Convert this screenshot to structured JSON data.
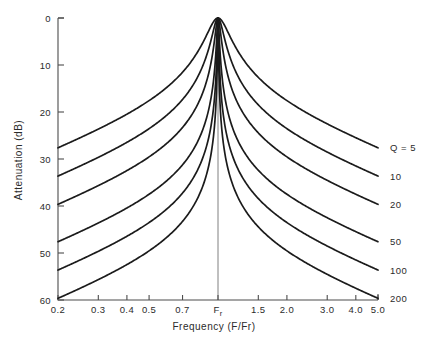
{
  "chart_data": {
    "type": "line",
    "title": "",
    "subtitle": "",
    "xlabel": "Frequency  (F/Fr)",
    "ylabel": "Attenuation  (dB)",
    "xscale": "log",
    "xlim": [
      0.2,
      5.0
    ],
    "ylim": [
      0,
      60
    ],
    "y_inverted": true,
    "grid": false,
    "legend_position": "right-inline",
    "x_tick_values": [
      0.2,
      0.3,
      0.4,
      0.5,
      0.7,
      1.0,
      1.5,
      2.0,
      3.0,
      4.0,
      5.0
    ],
    "x_tick_labels": [
      "0.2",
      "0.3",
      "0.4",
      "0.5",
      "0.7",
      "Fr",
      "1.5",
      "2.0",
      "3.0",
      "4.0",
      "5.0"
    ],
    "y_tick_values": [
      0,
      10,
      20,
      30,
      40,
      50,
      60
    ],
    "y_tick_labels": [
      "0",
      "10",
      "20",
      "30",
      "40",
      "50",
      "60"
    ],
    "center_marker": {
      "label": "Fr",
      "label_base": "F",
      "label_sub": "r",
      "value": 1.0
    },
    "series_label_prefix": "Q =",
    "series": [
      {
        "name": "Q = 5",
        "label": "Q = 5",
        "q": 5,
        "values_at_ticks": [
          {
            "x": 0.2,
            "y": 27.4
          },
          {
            "x": 0.3,
            "y": 20.8
          },
          {
            "x": 0.5,
            "y": 12.2
          },
          {
            "x": 0.7,
            "y": 6.5
          },
          {
            "x": 1.0,
            "y": 0.0
          },
          {
            "x": 1.5,
            "y": 7.9
          },
          {
            "x": 2.0,
            "y": 13.1
          },
          {
            "x": 3.0,
            "y": 20.0
          },
          {
            "x": 5.0,
            "y": 28.8
          }
        ]
      },
      {
        "name": "Q = 10",
        "label": "10",
        "q": 10,
        "values_at_ticks": [
          {
            "x": 0.2,
            "y": 33.3
          },
          {
            "x": 0.3,
            "y": 26.7
          },
          {
            "x": 0.5,
            "y": 17.8
          },
          {
            "x": 0.7,
            "y": 11.2
          },
          {
            "x": 1.0,
            "y": 0.0
          },
          {
            "x": 1.5,
            "y": 13.1
          },
          {
            "x": 2.0,
            "y": 18.8
          },
          {
            "x": 3.0,
            "y": 25.9
          },
          {
            "x": 5.0,
            "y": 34.7
          }
        ]
      },
      {
        "name": "Q = 20",
        "label": "20",
        "q": 20,
        "values_at_ticks": [
          {
            "x": 0.2,
            "y": 39.3
          },
          {
            "x": 0.3,
            "y": 32.7
          },
          {
            "x": 0.5,
            "y": 23.7
          },
          {
            "x": 0.7,
            "y": 16.7
          },
          {
            "x": 1.0,
            "y": 0.0
          },
          {
            "x": 1.5,
            "y": 18.8
          },
          {
            "x": 2.0,
            "y": 24.7
          },
          {
            "x": 3.0,
            "y": 31.9
          },
          {
            "x": 5.0,
            "y": 40.7
          }
        ]
      },
      {
        "name": "Q = 50",
        "label": "50",
        "q": 50,
        "values_at_ticks": [
          {
            "x": 0.2,
            "y": 47.2
          },
          {
            "x": 0.3,
            "y": 40.6
          },
          {
            "x": 0.5,
            "y": 31.6
          },
          {
            "x": 0.7,
            "y": 24.5
          },
          {
            "x": 1.0,
            "y": 0.0
          },
          {
            "x": 1.5,
            "y": 26.7
          },
          {
            "x": 2.0,
            "y": 32.7
          },
          {
            "x": 3.0,
            "y": 39.9
          },
          {
            "x": 5.0,
            "y": 48.6
          }
        ]
      },
      {
        "name": "Q = 100",
        "label": "100",
        "q": 100,
        "values_at_ticks": [
          {
            "x": 0.2,
            "y": 53.2
          },
          {
            "x": 0.3,
            "y": 46.6
          },
          {
            "x": 0.5,
            "y": 37.6
          },
          {
            "x": 0.7,
            "y": 30.5
          },
          {
            "x": 1.0,
            "y": 0.0
          },
          {
            "x": 1.5,
            "y": 32.7
          },
          {
            "x": 2.0,
            "y": 38.7
          },
          {
            "x": 3.0,
            "y": 45.9
          },
          {
            "x": 5.0,
            "y": 54.7
          }
        ]
      },
      {
        "name": "Q = 200",
        "label": "200",
        "q": 200,
        "values_at_ticks": [
          {
            "x": 0.2,
            "y": 59.2
          },
          {
            "x": 0.3,
            "y": 52.6
          },
          {
            "x": 0.5,
            "y": 43.6
          },
          {
            "x": 0.7,
            "y": 36.5
          },
          {
            "x": 1.0,
            "y": 0.0
          },
          {
            "x": 1.5,
            "y": 38.7
          },
          {
            "x": 2.0,
            "y": 44.7
          },
          {
            "x": 3.0,
            "y": 51.9
          },
          {
            "x": 5.0,
            "y": 60.0
          }
        ]
      }
    ],
    "annotations": [],
    "colors": {
      "curve": "#1b1b1b",
      "axis": "#4d4d4d",
      "center_line": "#808080",
      "background": "#ffffff",
      "text": "#2b2b2b"
    }
  }
}
